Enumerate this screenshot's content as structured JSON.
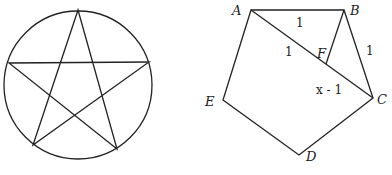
{
  "figures": {
    "pentagram": {
      "circle": {
        "cx": 78,
        "cy": 85,
        "r": 74
      },
      "points": [
        [
          78,
          10
        ],
        [
          117,
          149
        ],
        [
          9,
          63
        ],
        [
          149,
          62
        ],
        [
          33,
          145
        ]
      ]
    },
    "pentagon": {
      "vertices": {
        "A": {
          "x": 251,
          "y": 10
        },
        "B": {
          "x": 344,
          "y": 10
        },
        "C": {
          "x": 373,
          "y": 98
        },
        "D": {
          "x": 299,
          "y": 155
        },
        "E": {
          "x": 223,
          "y": 100
        },
        "F": {
          "x": 326,
          "y": 64
        }
      },
      "labels": {
        "A": "A",
        "B": "B",
        "C": "C",
        "D": "D",
        "E": "E",
        "F": "F"
      },
      "segment_labels": {
        "AB": "1",
        "BC": "1",
        "AF": "1",
        "FC": "x - 1"
      }
    }
  },
  "colors": {
    "stroke": "#222222",
    "background": "#ffffff"
  }
}
